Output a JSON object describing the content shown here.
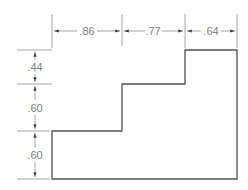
{
  "drawing": {
    "type": "stepped-profile-dimension-drawing",
    "horizontal_dimensions": [
      ".86",
      ".77",
      ".64"
    ],
    "vertical_dimensions": [
      ".44",
      ".60",
      ".60"
    ],
    "colors": {
      "outline": "#404040",
      "dimension": "#808080",
      "background": "#ffffff"
    }
  }
}
